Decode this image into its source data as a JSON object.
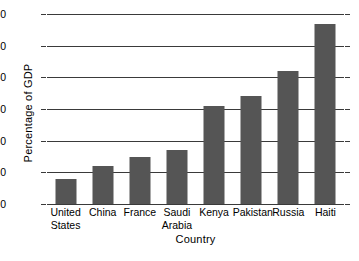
{
  "chart_data": {
    "type": "bar",
    "title": "",
    "xlabel": "Country",
    "ylabel": "Percentage of GDP",
    "categories": [
      "United States",
      "China",
      "France",
      "Saudi Arabia",
      "Kenya",
      "Pakistan",
      "Russia",
      "Haiti"
    ],
    "category_lines": [
      [
        "United",
        "States"
      ],
      [
        "China"
      ],
      [
        "France"
      ],
      [
        "Saudi",
        "Arabia"
      ],
      [
        "Kenya"
      ],
      [
        "Pakistan"
      ],
      [
        "Russia"
      ],
      [
        "Haiti"
      ]
    ],
    "values": [
      8,
      12,
      15,
      17,
      31,
      34,
      42,
      57
    ],
    "ylim": [
      0,
      60
    ],
    "yticks": [
      0,
      10,
      20,
      30,
      40,
      50,
      60
    ],
    "ytick_labels": [
      "0",
      "10",
      "20",
      "30",
      "40",
      "50",
      "60"
    ],
    "grid": true,
    "legend": false,
    "bar_color": "#555555",
    "axis_color": "#3a3a3a"
  }
}
